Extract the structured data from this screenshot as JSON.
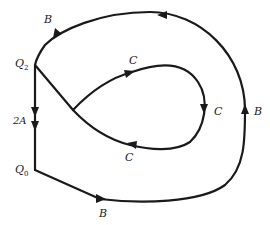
{
  "diagram": {
    "type": "state-transition-graph",
    "nodes": [
      {
        "id": "Q2",
        "label": "Q",
        "subscript": "2"
      },
      {
        "id": "Q0",
        "label": "Q",
        "subscript": "0"
      }
    ],
    "edges": [
      {
        "id": "edge-2A",
        "from": "Q2",
        "to": "Q0",
        "label": "2A",
        "arrows": 2
      },
      {
        "id": "edge-outer-bottom",
        "from": "Q0",
        "to": "outer-right",
        "label": "B"
      },
      {
        "id": "edge-outer-right",
        "from": "outer-bottom",
        "to": "outer-top",
        "label": "B"
      },
      {
        "id": "edge-outer-top",
        "from": "outer-right",
        "to": "Q2",
        "label": "B"
      },
      {
        "id": "edge-loop-upper",
        "label": "C"
      },
      {
        "id": "edge-loop-right",
        "label": "C"
      },
      {
        "id": "edge-loop-lower",
        "label": "C"
      }
    ],
    "labels": {
      "q2": {
        "main": "Q",
        "sub": "2"
      },
      "q0": {
        "main": "Q",
        "sub": "0"
      },
      "edge_2a": "2A",
      "b_top": "B",
      "b_right": "B",
      "b_bottom": "B",
      "c_upper": "C",
      "c_right": "C",
      "c_lower": "C"
    },
    "colors": {
      "stroke": "#1a1a1a",
      "background": "#ffffff"
    }
  }
}
